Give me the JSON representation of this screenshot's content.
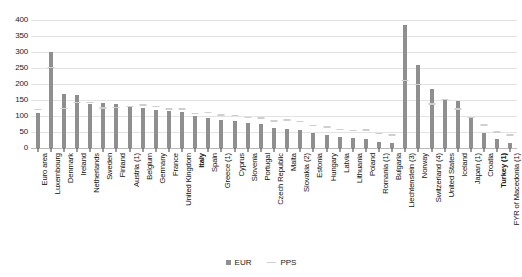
{
  "chart_data": {
    "type": "bar",
    "title": "",
    "subtitle": "",
    "xlabel": "",
    "ylabel": "",
    "ylim": [
      0,
      400
    ],
    "yticks": [
      0,
      50,
      100,
      150,
      200,
      250,
      300,
      350,
      400
    ],
    "grid": true,
    "legend_position": "bottom",
    "categories": [
      "Euro area",
      "Luxembourg",
      "Denmark",
      "Ireland",
      "Netherlands",
      "Sweden",
      "Finland",
      "Austria (1)",
      "Belgium",
      "Germany",
      "France",
      "United Kingdom",
      "Italy",
      "Spain",
      "Greece (1)",
      "Cyprus",
      "Slovenia",
      "Portugal",
      "Czech Republic",
      "Malta",
      "Slovakia (2)",
      "Estonia",
      "Hungary",
      "Latvia",
      "Lithuania",
      "Poland",
      "Romania (1)",
      "Bulgaria",
      "Liechtenstein (3)",
      "Norway",
      "Switzerland (4)",
      "United States",
      "Iceland",
      "Japan (1)",
      "Croatia",
      "Turkey (1)",
      "FYR of Macedonia (1)"
    ],
    "bold_categories": [
      "Italy",
      "Turkey (1)"
    ],
    "series": [
      {
        "name": "EUR",
        "color": "#8f8f8f",
        "values": [
          110,
          300,
          168,
          166,
          136,
          141,
          139,
          127,
          125,
          118,
          117,
          113,
          99,
          95,
          88,
          85,
          78,
          74,
          62,
          60,
          56,
          48,
          41,
          34,
          30,
          28,
          20,
          15,
          385,
          258,
          183,
          150,
          146,
          97,
          48,
          28,
          16
        ]
      },
      {
        "name": "PPS",
        "color": "#cfcfcf",
        "values": [
          118,
          250,
          122,
          140,
          140,
          123,
          124,
          128,
          132,
          128,
          120,
          120,
          105,
          108,
          101,
          100,
          94,
          92,
          82,
          85,
          80,
          69,
          64,
          55,
          52,
          54,
          43,
          38,
          208,
          196,
          135,
          150,
          120,
          93,
          70,
          48,
          38
        ]
      }
    ]
  },
  "legend": {
    "entries": [
      {
        "label": "EUR",
        "marker": "square-marker"
      },
      {
        "label": "PPS",
        "marker": "dash-marker"
      }
    ]
  },
  "colors": {
    "eur_bar": "#8f8f8f",
    "pps_marker": "#cfcfcf",
    "gridline": "#e3e3e3",
    "baseline": "#b9b9b9",
    "text": "#101010",
    "background": "#ffffff"
  }
}
